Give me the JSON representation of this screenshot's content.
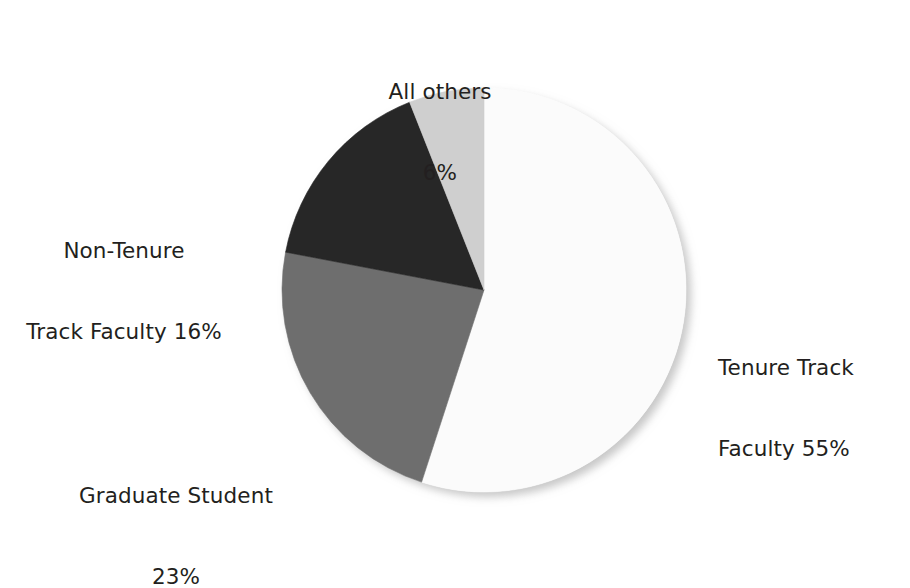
{
  "chart_data": {
    "type": "pie",
    "title": "",
    "subtitle": "",
    "xlabel": "",
    "ylabel": "",
    "legend_position": "none",
    "grid": false,
    "start_angle_deg": 0,
    "direction": "clockwise",
    "categories": [
      "Tenure Track Faculty",
      "Graduate Student",
      "Non-Tenure Track Faculty",
      "All others"
    ],
    "values": [
      55,
      23,
      16,
      6
    ],
    "value_unit": "percent",
    "colors": [
      "#FBFBFB",
      "#6E6E6E",
      "#272727",
      "#CFCFCF"
    ],
    "slices": [
      {
        "name": "Tenure Track Faculty",
        "value": 55,
        "value_text": "55%",
        "color": "#FBFBFB",
        "label_line1": "Tenure Track",
        "label_line2": "Faculty 55%"
      },
      {
        "name": "Graduate Student",
        "value": 23,
        "value_text": "23%",
        "color": "#6E6E6E",
        "label_line1": "Graduate Student",
        "label_line2": "23%"
      },
      {
        "name": "Non-Tenure Track Faculty",
        "value": 16,
        "value_text": "16%",
        "color": "#272727",
        "label_line1": "Non-Tenure",
        "label_line2": "Track Faculty 16%"
      },
      {
        "name": "All others",
        "value": 6,
        "value_text": "6%",
        "color": "#CFCFCF",
        "label_line1": "All others",
        "label_line2": "6%"
      }
    ]
  },
  "figure": {
    "background_color": "#FFFFFF",
    "text_color": "#231F20",
    "pie_center_x": 484,
    "pie_center_y": 290,
    "pie_radius": 202
  }
}
